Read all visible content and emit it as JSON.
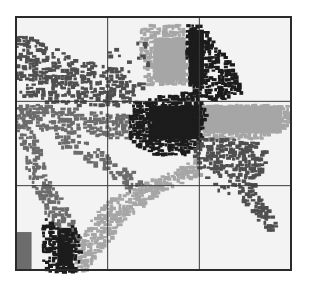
{
  "chart_data": {
    "type": "scatter",
    "title": "",
    "xlabel": "",
    "ylabel": "",
    "xlim": [
      0,
      3
    ],
    "ylim": [
      0,
      3
    ],
    "grid": true,
    "grid_divisions": {
      "x": [
        1,
        2
      ],
      "y": [
        1,
        2
      ]
    },
    "legend": "none",
    "background_color": "#f3f3f3",
    "frame_color": "#2a2a2a",
    "grid_color": "#3a3a3a",
    "tones": {
      "black": "#1c1c1c",
      "dark": "#4f4f4f",
      "mid": "#6c6c6c",
      "light": "#a6a6a6"
    },
    "series": [
      {
        "name": "upper-left dark scatter",
        "tone": "dark",
        "density": 0.55,
        "shape": "polygon",
        "points": [
          [
            0,
            2.85
          ],
          [
            0.6,
            2.55
          ],
          [
            1.25,
            2.35
          ],
          [
            1.3,
            2.0
          ],
          [
            0.9,
            1.95
          ],
          [
            0.3,
            2.0
          ],
          [
            0,
            2.1
          ]
        ]
      },
      {
        "name": "left arc band",
        "tone": "mid",
        "density": 0.6,
        "shape": "polygon",
        "points": [
          [
            0,
            2.0
          ],
          [
            0.5,
            1.95
          ],
          [
            1.2,
            1.85
          ],
          [
            1.5,
            1.75
          ],
          [
            1.2,
            1.55
          ],
          [
            0.6,
            1.65
          ],
          [
            0.2,
            1.7
          ],
          [
            0.3,
            1.2
          ],
          [
            0.6,
            0.6
          ],
          [
            0.7,
            0.35
          ],
          [
            0.55,
            0.3
          ],
          [
            0.2,
            0.9
          ],
          [
            0,
            1.6
          ]
        ]
      },
      {
        "name": "center diagonal band",
        "tone": "mid",
        "density": 0.45,
        "shape": "polygon",
        "points": [
          [
            0.35,
            1.75
          ],
          [
            0.7,
            1.6
          ],
          [
            1.1,
            1.3
          ],
          [
            1.4,
            1.1
          ],
          [
            1.3,
            0.9
          ],
          [
            1.0,
            1.1
          ],
          [
            0.7,
            1.35
          ],
          [
            0.45,
            1.5
          ]
        ]
      },
      {
        "name": "light fan",
        "tone": "light",
        "density": 0.8,
        "shape": "polygon",
        "points": [
          [
            0.6,
            0.0
          ],
          [
            0.75,
            0.55
          ],
          [
            1.0,
            0.85
          ],
          [
            1.4,
            1.05
          ],
          [
            1.8,
            1.25
          ],
          [
            2.0,
            1.35
          ],
          [
            2.0,
            1.15
          ],
          [
            1.6,
            0.95
          ],
          [
            1.2,
            0.65
          ],
          [
            0.95,
            0.3
          ],
          [
            0.75,
            0.0
          ]
        ]
      },
      {
        "name": "light upper tower",
        "tone": "light",
        "density": 0.8,
        "shape": "polygon",
        "points": [
          [
            1.35,
            2.9
          ],
          [
            1.75,
            2.95
          ],
          [
            1.85,
            2.85
          ],
          [
            1.85,
            2.2
          ],
          [
            1.4,
            2.2
          ],
          [
            1.35,
            2.5
          ]
        ]
      },
      {
        "name": "light right block",
        "tone": "light",
        "density": 0.9,
        "shape": "polygon",
        "points": [
          [
            2.0,
            2.0
          ],
          [
            2.95,
            2.0
          ],
          [
            2.95,
            1.7
          ],
          [
            2.6,
            1.55
          ],
          [
            2.0,
            1.55
          ]
        ]
      },
      {
        "name": "central black core",
        "tone": "black",
        "density": 0.85,
        "shape": "polygon",
        "points": [
          [
            1.25,
            2.0
          ],
          [
            1.65,
            2.1
          ],
          [
            1.95,
            2.15
          ],
          [
            2.05,
            1.9
          ],
          [
            2.0,
            1.45
          ],
          [
            1.75,
            1.35
          ],
          [
            1.4,
            1.4
          ],
          [
            1.2,
            1.6
          ]
        ]
      },
      {
        "name": "black upper streak",
        "tone": "black",
        "density": 0.75,
        "shape": "polygon",
        "points": [
          [
            1.85,
            2.95
          ],
          [
            2.0,
            2.95
          ],
          [
            2.15,
            2.7
          ],
          [
            2.35,
            2.45
          ],
          [
            2.45,
            2.1
          ],
          [
            2.1,
            2.0
          ],
          [
            1.9,
            2.1
          ],
          [
            1.85,
            2.5
          ]
        ]
      },
      {
        "name": "right descending arm",
        "tone": "dark",
        "density": 0.6,
        "shape": "polygon",
        "points": [
          [
            2.0,
            1.6
          ],
          [
            2.6,
            1.55
          ],
          [
            2.75,
            1.35
          ],
          [
            2.6,
            1.0
          ],
          [
            2.85,
            0.55
          ],
          [
            2.75,
            0.45
          ],
          [
            2.45,
            0.85
          ],
          [
            2.3,
            1.1
          ],
          [
            2.0,
            1.25
          ],
          [
            1.9,
            1.4
          ]
        ]
      },
      {
        "name": "lower-left black cluster",
        "tone": "black",
        "density": 0.7,
        "shape": "polygon",
        "points": [
          [
            0.3,
            0.65
          ],
          [
            0.45,
            0.5
          ],
          [
            0.65,
            0.55
          ],
          [
            0.7,
            0.3
          ],
          [
            0.65,
            0.0
          ],
          [
            0.3,
            0.0
          ],
          [
            0.25,
            0.3
          ]
        ]
      },
      {
        "name": "upper-middle sparse squares",
        "tone": "dark",
        "density": 0.12,
        "shape": "polygon",
        "points": [
          [
            0.9,
            2.6
          ],
          [
            1.4,
            2.75
          ],
          [
            1.45,
            2.2
          ],
          [
            1.0,
            2.1
          ]
        ]
      },
      {
        "name": "lower-right sparse squares",
        "tone": "dark",
        "density": 0.15,
        "shape": "polygon",
        "points": [
          [
            1.95,
            1.3
          ],
          [
            2.3,
            1.2
          ],
          [
            2.35,
            0.9
          ],
          [
            2.0,
            1.0
          ]
        ]
      }
    ],
    "solid_regions": [
      {
        "name": "lower-left gray block",
        "tone": "mid",
        "x": [
          0.0,
          0.17
        ],
        "y": [
          0.0,
          0.45
        ]
      },
      {
        "name": "light tower core",
        "tone": "light",
        "x": [
          1.5,
          1.85
        ],
        "y": [
          2.25,
          2.75
        ]
      },
      {
        "name": "right light block core",
        "tone": "light",
        "x": [
          2.05,
          2.9
        ],
        "y": [
          1.62,
          1.95
        ]
      },
      {
        "name": "black core block",
        "tone": "black",
        "x": [
          1.45,
          2.0
        ],
        "y": [
          1.55,
          1.95
        ]
      },
      {
        "name": "black streak core",
        "tone": "black",
        "x": [
          1.88,
          2.05
        ],
        "y": [
          2.2,
          2.85
        ]
      },
      {
        "name": "black cluster core",
        "tone": "black",
        "x": [
          0.45,
          0.62
        ],
        "y": [
          0.05,
          0.5
        ]
      }
    ]
  }
}
